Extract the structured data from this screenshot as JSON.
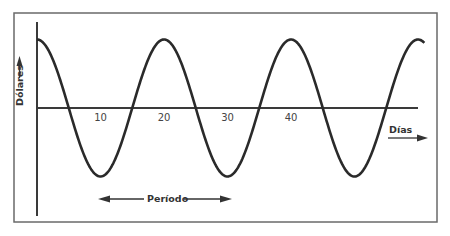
{
  "chart_data": {
    "type": "line",
    "title": "",
    "xlabel": "Días",
    "ylabel": "Dólares",
    "annotation": "Período",
    "x_ticks": [
      10,
      20,
      30,
      40
    ],
    "xlim": [
      0,
      61
    ],
    "ylim": [
      -1.15,
      1.15
    ],
    "grid": false,
    "legend": "none",
    "series": [
      {
        "name": "ciclo",
        "function": "cosine",
        "amplitude": 1,
        "period_days": 20,
        "phase_days": 0,
        "x_start": 0,
        "x_end": 61,
        "peaks_at": [
          0,
          20,
          40,
          60
        ],
        "troughs_at": [
          10,
          30,
          50
        ]
      }
    ]
  },
  "colors": {
    "line": "#2a2a2a",
    "frame": "#6a6a6a",
    "background": "#ffffff"
  }
}
